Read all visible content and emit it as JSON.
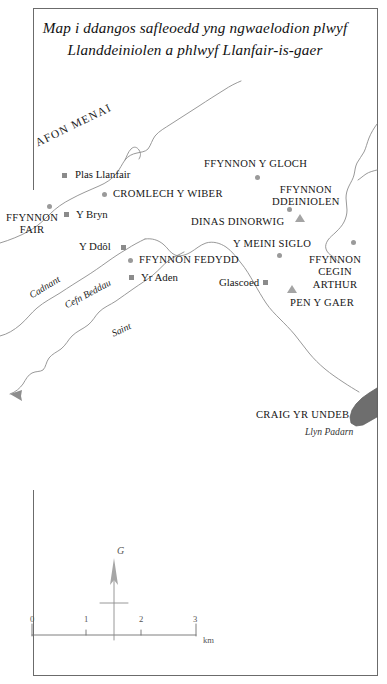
{
  "title": {
    "line1": "Map i ddangos safleoedd yng ngwaelodion plwyf",
    "line2": "Llanddeiniolen a phlwyf Llanfair-is-gaer"
  },
  "colors": {
    "ink": "#161616",
    "line": "#8d8d8d",
    "marker_square": "#8b8b8b",
    "marker_circle": "#9a9a9a",
    "marker_triangle": "#a4a4a4",
    "lake_fill": "#6e6e6e",
    "frame": "#6b6b6b"
  },
  "map": {
    "water_labels": [
      {
        "name": "afon-menai",
        "text": "AFON MENAI",
        "x": 36,
        "y": 137,
        "rotate": -26,
        "size": 11.4,
        "style": "caps"
      },
      {
        "name": "cadnant",
        "text": "Cadnant",
        "x": 30,
        "y": 290,
        "rotate": -31,
        "size": 9.8,
        "style": "italic"
      },
      {
        "name": "cefn-beddau",
        "text": "Cefn Beddau",
        "x": 65,
        "y": 300,
        "rotate": -28,
        "size": 9.8,
        "style": "italic"
      },
      {
        "name": "saint",
        "text": "Saint",
        "x": 112,
        "y": 328,
        "rotate": -24,
        "size": 9.8,
        "style": "italic"
      }
    ],
    "sites": [
      {
        "name": "plas-llanfair",
        "text": "Plas Llanfair",
        "type": "settlement",
        "label_x": 75,
        "label_y": 168,
        "marker_x": 62,
        "marker_y": 173,
        "marker": "square"
      },
      {
        "name": "cromlech-y-wiber",
        "text": "CROMLECH Y WIBER",
        "type": "monument",
        "label_x": 113,
        "label_y": 188,
        "marker_x": 102,
        "marker_y": 192,
        "marker": "circle"
      },
      {
        "name": "y-bryn",
        "text": "Y Bryn",
        "type": "settlement",
        "label_x": 76,
        "label_y": 208,
        "marker_x": 64,
        "marker_y": 212,
        "marker": "square"
      },
      {
        "name": "ffynnon-fair",
        "text": "FFYNNON\nFAIR",
        "type": "well",
        "label_x": 6,
        "label_y": 212,
        "marker_x": 47,
        "marker_y": 204,
        "marker": "circle"
      },
      {
        "name": "y-ddol",
        "text": "Y Ddôl",
        "type": "settlement",
        "label_x": 79,
        "label_y": 240,
        "marker_x": 121,
        "marker_y": 245,
        "marker": "square"
      },
      {
        "name": "ffynnon-fedydd",
        "text": "FFYNNON FEDYDD",
        "type": "well",
        "label_x": 139,
        "label_y": 254,
        "marker_x": 128,
        "marker_y": 258,
        "marker": "circle"
      },
      {
        "name": "yr-aden",
        "text": "Yr Aden",
        "type": "settlement",
        "label_x": 141,
        "label_y": 271,
        "marker_x": 129,
        "marker_y": 275,
        "marker": "square"
      },
      {
        "name": "ffynnon-y-gloch",
        "text": "FFYNNON Y GLOCH",
        "type": "well",
        "label_x": 204,
        "label_y": 158,
        "marker_x": 255,
        "marker_y": 175,
        "marker": "circle"
      },
      {
        "name": "ffynnon-ddeiniolen",
        "text": "FFYNNON\nDDEINIOLEN",
        "type": "well",
        "label_x": 272,
        "label_y": 184,
        "marker_x": 287,
        "marker_y": 207,
        "marker": "circle"
      },
      {
        "name": "dinas-dinorwig",
        "text": "DINAS DINORWIG",
        "type": "hillfort",
        "label_x": 191,
        "label_y": 216,
        "marker_x": 295,
        "marker_y": 214,
        "marker": "triangle"
      },
      {
        "name": "y-meini-siglo",
        "text": "Y MEINI SIGLO",
        "type": "monument",
        "label_x": 233,
        "label_y": 238,
        "marker_x": 277,
        "marker_y": 253,
        "marker": "circle"
      },
      {
        "name": "glascoed",
        "text": "Glascoed",
        "type": "settlement",
        "label_x": 219,
        "label_y": 276,
        "marker_x": 263,
        "marker_y": 280,
        "marker": "square"
      },
      {
        "name": "ffynnon-cegin-arthur",
        "text": "FFYNNON\nCEGIN\nARTHUR",
        "type": "well",
        "label_x": 309,
        "label_y": 254,
        "marker_x": 351,
        "marker_y": 240,
        "marker": "circle"
      },
      {
        "name": "pen-y-gaer",
        "text": "PEN Y GAER",
        "type": "hillfort",
        "label_x": 290,
        "label_y": 297,
        "marker_x": 287,
        "marker_y": 285,
        "marker": "triangle"
      },
      {
        "name": "craig-yr-undeb",
        "text": "CRAIG YR UNDEB",
        "type": "rock",
        "label_x": 256,
        "label_y": 409,
        "marker_x": null,
        "marker_y": null,
        "marker": "none"
      }
    ],
    "lake": {
      "name": "llyn-padarn",
      "text": "Llyn Padarn",
      "label_x": 305,
      "label_y": 426
    }
  },
  "legend": {
    "north_arrow_label": "G",
    "scale": {
      "ticks": [
        "0",
        "1",
        "2",
        "3"
      ],
      "tick_x": [
        30,
        84,
        139,
        193
      ],
      "unit": "km",
      "start_x": 32,
      "end_x": 196,
      "y": 630
    }
  }
}
